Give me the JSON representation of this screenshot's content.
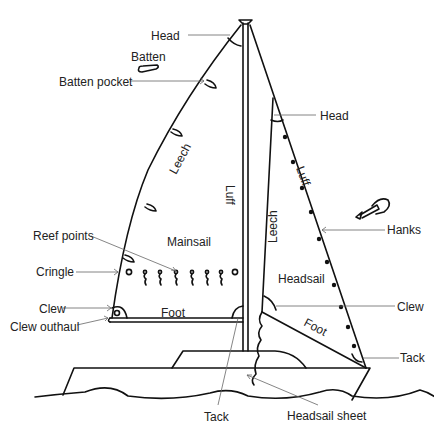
{
  "diagram": {
    "labels": {
      "head_main": "Head",
      "batten": "Batten",
      "batten_pocket": "Batten pocket",
      "head_headsail": "Head",
      "leech_main": "Leech",
      "luff_main": "Luff",
      "luff_headsail": "Luff",
      "leech_headsail": "Leech",
      "hanks": "Hanks",
      "reef_points": "Reef points",
      "mainsail": "Mainsail",
      "headsail": "Headsail",
      "cringle": "Cringle",
      "clew_main": "Clew",
      "foot_main": "Foot",
      "clew_outhaul": "Clew outhaul",
      "clew_headsail": "Clew",
      "foot_headsail": "Foot",
      "tack_headsail": "Tack",
      "tack_main": "Tack",
      "headsail_sheet": "Headsail sheet"
    },
    "colors": {
      "line": "#111111",
      "leader": "#666666",
      "text": "#222222",
      "background": "#ffffff"
    }
  }
}
